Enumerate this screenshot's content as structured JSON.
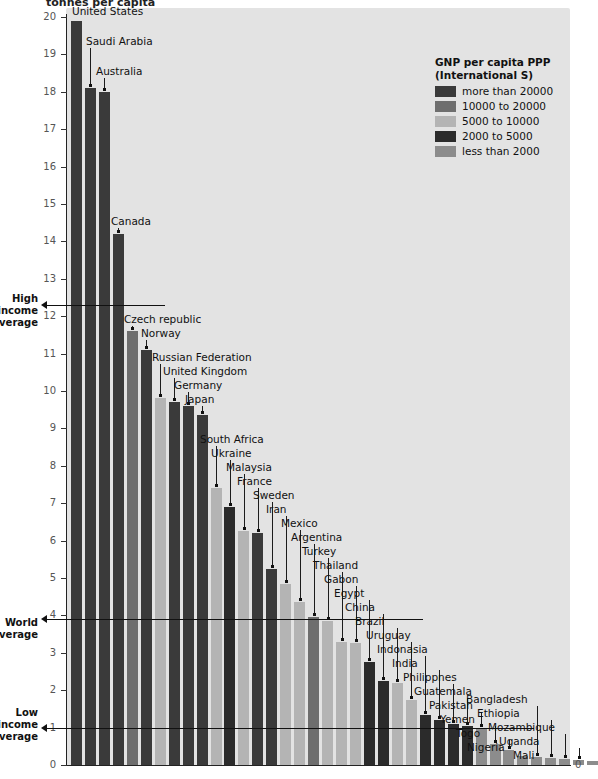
{
  "chart_data": {
    "type": "bar",
    "title": "tonnes per capita",
    "ylabel": "tonnes per capita",
    "xlabel": "",
    "ylim": [
      0,
      20
    ],
    "ytick_labels": [
      "0",
      "1",
      "2",
      "3",
      "4",
      "5",
      "6",
      "7",
      "8",
      "9",
      "10",
      "11",
      "12",
      "13",
      "14",
      "15",
      "16",
      "17",
      "18",
      "19",
      "20"
    ],
    "grid": false,
    "legend_position": "top-right",
    "categories": [
      "United States",
      "Saudi Arabia",
      "Australia",
      "Canada",
      "Czech republic",
      "Norway",
      "Russian Federation",
      "United Kingdom",
      "Germany",
      "Japan",
      "South Africa",
      "Ukraine",
      "Malaysia",
      "France",
      "Sweden",
      "Iran",
      "Mexico",
      "Argentina",
      "Turkey",
      "Thailand",
      "Gabon",
      "Egypt",
      "China",
      "Brazil",
      "Uruguay",
      "Indonasia",
      "India",
      "Philippnes",
      "Guatemala",
      "Pakistan",
      "Yemen",
      "Togo",
      "Nigeria",
      "Bangladesh",
      "Ethiopia",
      "Mozambique",
      "Uganda",
      "Mali"
    ],
    "values": [
      19.9,
      18.1,
      18.0,
      14.2,
      11.6,
      11.1,
      9.8,
      9.7,
      9.6,
      9.35,
      7.4,
      6.9,
      6.25,
      6.2,
      5.25,
      4.85,
      4.35,
      3.95,
      3.85,
      3.3,
      3.25,
      2.75,
      2.25,
      2.2,
      1.75,
      1.35,
      1.2,
      1.1,
      1.05,
      1.0,
      0.55,
      0.4,
      0.25,
      0.22,
      0.18,
      0.16,
      0.14,
      0.12
    ],
    "group_of": [
      "more than 20000",
      "more than 20000",
      "more than 20000",
      "more than 20000",
      "10000 to 20000",
      "more than 20000",
      "5000 to 10000",
      "more than 20000",
      "more than 20000",
      "more than 20000",
      "5000 to 10000",
      "2000 to 5000",
      "5000 to 10000",
      "more than 20000",
      "more than 20000",
      "5000 to 10000",
      "5000 to 10000",
      "10000 to 20000",
      "5000 to 10000",
      "5000 to 10000",
      "5000 to 10000",
      "2000 to 5000",
      "2000 to 5000",
      "5000 to 10000",
      "5000 to 10000",
      "2000 to 5000",
      "2000 to 5000",
      "2000 to 5000",
      "2000 to 5000",
      "less than 2000",
      "less than 2000",
      "less than 2000",
      "less than 2000",
      "less than 2000",
      "less than 2000",
      "less than 2000",
      "less than 2000",
      "less than 2000"
    ],
    "annotations": [
      {
        "label": "High income average",
        "value": 12.3
      },
      {
        "label": "World average",
        "value": 3.9
      },
      {
        "label": "Low income average",
        "value": 1.0
      }
    ]
  },
  "legend": {
    "title_line1": "GNP per capita PPP",
    "title_line2": "(International S)",
    "items": [
      {
        "label": "more than 20000",
        "color": "#3a3a3a"
      },
      {
        "label": "10000 to 20000",
        "color": "#6e6e6e"
      },
      {
        "label": "5000 to 10000",
        "color": "#b4b4b4"
      },
      {
        "label": "2000 to 5000",
        "color": "#2b2b2b"
      },
      {
        "label": "less than 2000",
        "color": "#8c8c8c"
      }
    ]
  },
  "annotations": {
    "high_income": {
      "line1": "High",
      "line2": "income",
      "line3": "average"
    },
    "world": {
      "line1": "World",
      "line2": "average"
    },
    "low_income": {
      "line1": "Low",
      "line2": "income",
      "line3": "average"
    }
  },
  "axis": {
    "zero_right_label": "0"
  }
}
